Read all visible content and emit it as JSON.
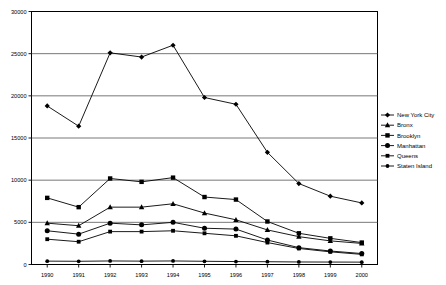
{
  "chart_data": {
    "type": "line",
    "title": "",
    "xlabel": "",
    "ylabel": "",
    "grid": true,
    "legend_position": "right",
    "ylim": [
      0,
      30000
    ],
    "yticks": [
      0,
      5000,
      10000,
      15000,
      20000,
      25000,
      30000
    ],
    "ytick_labels": [
      "0",
      "5000",
      "10000",
      "15000",
      "20000",
      "25000",
      "30000"
    ],
    "categories": [
      "1990",
      "1991",
      "1992",
      "1993",
      "1994",
      "1995",
      "1996",
      "1997",
      "1998",
      "1999",
      "2000"
    ],
    "series": [
      {
        "name": "New York City",
        "marker": "diamond",
        "color": "#000000",
        "values": [
          18800,
          16400,
          25100,
          24600,
          26000,
          19800,
          19000,
          13300,
          9600,
          8100,
          7300
        ]
      },
      {
        "name": "Bronx",
        "marker": "triangle",
        "color": "#000000",
        "values": [
          4900,
          4600,
          6800,
          6800,
          7200,
          6100,
          5300,
          4100,
          3300,
          2800,
          2500
        ]
      },
      {
        "name": "Brooklyn",
        "marker": "square",
        "color": "#000000",
        "values": [
          7900,
          6800,
          10200,
          9800,
          10300,
          8000,
          7700,
          5100,
          3700,
          3100,
          2600
        ]
      },
      {
        "name": "Manhattan",
        "marker": "circle",
        "color": "#000000",
        "values": [
          4000,
          3600,
          4900,
          4700,
          5000,
          4300,
          4200,
          2900,
          2000,
          1600,
          1300
        ]
      },
      {
        "name": "Queens",
        "marker": "square-small",
        "color": "#000000",
        "values": [
          3000,
          2700,
          3900,
          3900,
          4000,
          3700,
          3400,
          2600,
          1900,
          1500,
          1200
        ]
      },
      {
        "name": "Staten Island",
        "marker": "circle-small",
        "color": "#000000",
        "values": [
          400,
          380,
          420,
          400,
          420,
          380,
          350,
          330,
          300,
          290,
          280
        ]
      }
    ]
  },
  "legend": {
    "items": [
      {
        "label": "New York City"
      },
      {
        "label": "Bronx"
      },
      {
        "label": "Brooklyn"
      },
      {
        "label": "Manhattan"
      },
      {
        "label": "Queens"
      },
      {
        "label": "Staten Island"
      }
    ]
  }
}
